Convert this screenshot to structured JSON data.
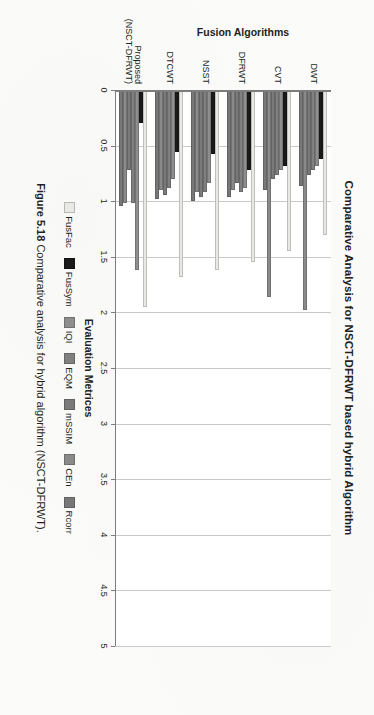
{
  "figure": {
    "caption_number": "Figure 5.18",
    "caption_text": "Comparative analysis for hybrid algorithm (NSCT-DFRWT)."
  },
  "chart_data": {
    "type": "bar",
    "orientation": "horizontal",
    "title": "Comparative Analysis for NSCT-DFRWT based hybrid Algorithm",
    "xlabel": "Evaluation Metrices",
    "ylabel": "Fusion Algorithms",
    "xlim": [
      0,
      5
    ],
    "grid": true,
    "legend_position": "bottom",
    "tick_labels": [
      "0",
      "0.5",
      "1",
      "1.5",
      "2",
      "2.5",
      "3",
      "3.5",
      "4",
      "4.5",
      "5"
    ],
    "tick_values": [
      0,
      0.5,
      1,
      1.5,
      2,
      2.5,
      3,
      3.5,
      4,
      4.5,
      5
    ],
    "categories": [
      "DWT",
      "CVT",
      "DFRWT",
      "NSST",
      "DTCWT",
      "Proposed (NSCT-DFRWT)"
    ],
    "series": [
      {
        "name": "FusFac",
        "color": "#e8e8e4",
        "values": [
          1.3,
          1.45,
          1.55,
          1.62,
          1.68,
          1.95
        ]
      },
      {
        "name": "FusSym",
        "color": "#1a1a1a",
        "values": [
          0.62,
          0.68,
          0.72,
          0.58,
          0.56,
          0.3
        ]
      },
      {
        "name": "IQI",
        "color": "#8e8e8e",
        "values": [
          0.68,
          0.72,
          0.88,
          0.84,
          0.8,
          1.62
        ]
      },
      {
        "name": "EQM",
        "color": "#808080",
        "values": [
          0.72,
          0.76,
          0.92,
          0.92,
          0.88,
          1.02
        ]
      },
      {
        "name": "mSSIM",
        "color": "#7a7a7a",
        "values": [
          0.76,
          0.8,
          0.84,
          0.96,
          0.94,
          0.72
        ]
      },
      {
        "name": "CEn",
        "color": "#8a8a8a",
        "values": [
          1.98,
          1.86,
          0.9,
          0.92,
          0.9,
          1.02
        ]
      },
      {
        "name": "Rcorr",
        "color": "#787878",
        "values": [
          0.86,
          0.9,
          0.96,
          1.0,
          0.98,
          1.04
        ]
      }
    ]
  }
}
